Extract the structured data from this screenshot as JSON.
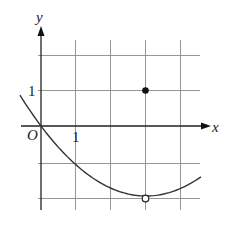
{
  "figure": {
    "axis_labels": {
      "x": "x",
      "y": "y"
    },
    "origin_label": "O",
    "tick_labels": {
      "x_one": "1",
      "y_one": "1"
    },
    "grid": {
      "x_min": -0.6,
      "x_max": 4.6,
      "y_min": -2.3,
      "y_max": 2,
      "spacing": 1
    },
    "curve": {
      "description": "parabola through origin with vertex at (3,-2)",
      "equation": "y = (2/9)(x-3)^2 - 2",
      "x_range": [
        -0.6,
        4.57
      ]
    },
    "points": [
      {
        "name": "filled-point",
        "x": 3,
        "y": 1,
        "style": "filled"
      },
      {
        "name": "open-point",
        "x": 3,
        "y": -2,
        "style": "open"
      }
    ],
    "colors": {
      "grid": "#8a8a8a",
      "axis": "#222222",
      "curve": "#333333"
    }
  }
}
